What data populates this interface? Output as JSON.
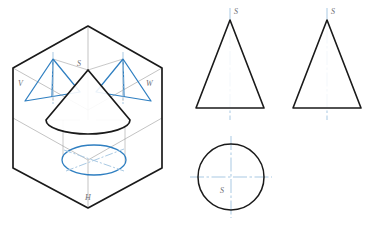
{
  "figure": {
    "background_color": "#ffffff",
    "line_color_solid": "#1a1a1a",
    "line_color_projection": "#2f7fc1",
    "line_color_axis": "#a9c9e3",
    "line_color_thin": "#9a9a9a",
    "label_color": "#6e6e73"
  },
  "isometric": {
    "name": "three-plane-projection-box",
    "plane_labels": [
      {
        "id": "v-plane-label",
        "text": "V",
        "x": 18,
        "y": 86
      },
      {
        "id": "w-plane-label",
        "text": "W",
        "x": 148,
        "y": 86
      },
      {
        "id": "h-plane-label",
        "text": "H",
        "x": 86,
        "y": 200
      }
    ],
    "apex_label": {
      "id": "cone-apex-label",
      "text": "S",
      "x": 78,
      "y": 65
    },
    "hexagon_vertices": "88,26 162,68 162,168 88,208 13,168 13,68",
    "cone": {
      "apex_x": 88,
      "apex_y": 70,
      "base_center_x": 88,
      "base_center_y": 120,
      "base_rx": 42,
      "base_ry": 14
    },
    "h_ellipse": {
      "cx": 94,
      "cy": 160,
      "rx": 32,
      "ry": 15
    },
    "v_triangle": {
      "apex": "53,59",
      "left": "25,101",
      "right": "80,92"
    },
    "w_triangle": {
      "apex": "123,59",
      "left": "96,92",
      "right": "151,101"
    }
  },
  "views": [
    {
      "name": "front-view-triangle",
      "label": "S",
      "label_x": 234,
      "label_y": 14,
      "apex_x": 230,
      "apex_y": 20,
      "base_y": 108,
      "base_left_x": 196,
      "base_right_x": 264,
      "centerline_top": 8,
      "centerline_bottom": 120
    },
    {
      "name": "side-view-triangle",
      "label": "S",
      "label_x": 331,
      "label_y": 14,
      "apex_x": 327,
      "apex_y": 20,
      "base_y": 108,
      "base_left_x": 293,
      "base_right_x": 361,
      "centerline_top": 8,
      "centerline_bottom": 120
    }
  ],
  "top_view": {
    "name": "top-view-circle",
    "label": "S",
    "label_x": 222,
    "label_y": 193,
    "cx": 231,
    "cy": 177,
    "r": 33,
    "centerline_h_left": 190,
    "centerline_h_right": 272,
    "centerline_v_top": 136,
    "centerline_v_bottom": 218
  }
}
